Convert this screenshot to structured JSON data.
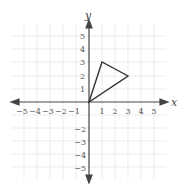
{
  "diagram": {
    "type": "coordinate-plane",
    "x_axis_label": "x",
    "y_axis_label": "y",
    "x_range": [
      -5,
      5
    ],
    "y_range": [
      -5,
      5
    ],
    "x_ticks": [
      "−5",
      "−4",
      "−3",
      "−2",
      "−1",
      "1",
      "2",
      "3",
      "4",
      "5"
    ],
    "y_ticks_positive": [
      "5",
      "4",
      "3",
      "2",
      "1"
    ],
    "y_ticks_negative": [
      "−2",
      "−3",
      "−4",
      "−5"
    ],
    "shape": {
      "type": "triangle",
      "vertices": [
        [
          0,
          0
        ],
        [
          1,
          3
        ],
        [
          3,
          2
        ]
      ]
    },
    "colors": {
      "grid": "#c8c8c8",
      "axis": "#444444",
      "shape": "#333333"
    }
  }
}
